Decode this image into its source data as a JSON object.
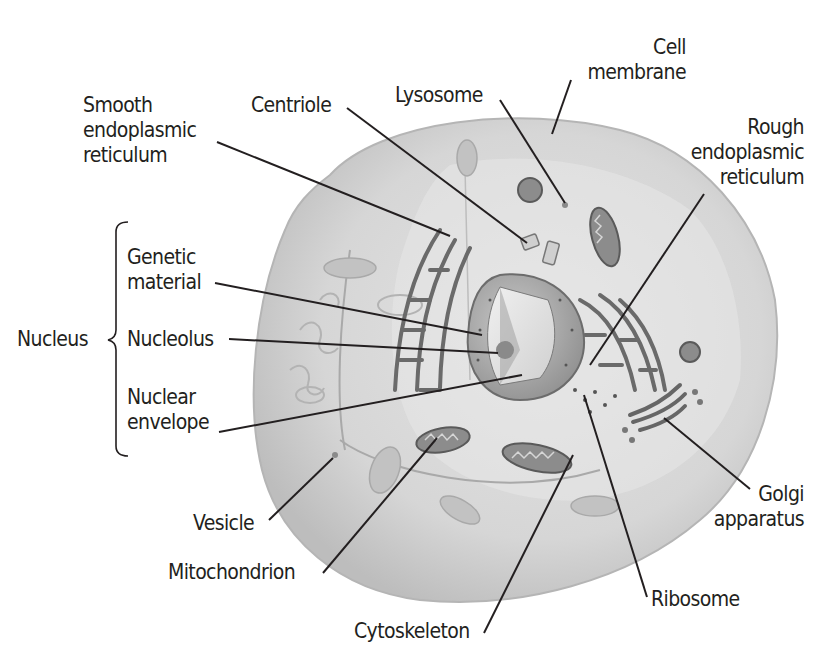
{
  "colors": {
    "background": "#ffffff",
    "cytoplasm": "#d8d8d8",
    "cell_edge": "#a8a8a8",
    "nucleus": "#8a8a8a",
    "organelle": "#6d6d6d",
    "leader_line": "#231f20",
    "text": "#231f20"
  },
  "labels": {
    "smooth_er": [
      "Smooth",
      "endoplasmic",
      "reticulum"
    ],
    "centriole": [
      "Centriole"
    ],
    "lysosome": [
      "Lysosome"
    ],
    "cell_membrane": [
      "Cell",
      "membrane"
    ],
    "rough_er": [
      "Rough",
      "endoplasmic",
      "reticulum"
    ],
    "nucleus_group": "Nucleus",
    "genetic_material": [
      "Genetic",
      "material"
    ],
    "nucleolus": [
      "Nucleolus"
    ],
    "nuclear_envelope": [
      "Nuclear",
      "envelope"
    ],
    "vesicle": [
      "Vesicle"
    ],
    "mitochondrion": [
      "Mitochondrion"
    ],
    "cytoskeleton": [
      "Cytoskeleton"
    ],
    "ribosome": [
      "Ribosome"
    ],
    "golgi": [
      "Golgi",
      "apparatus"
    ]
  }
}
